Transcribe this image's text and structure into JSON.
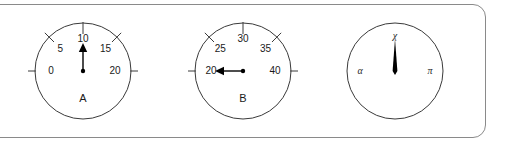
{
  "panel": {
    "border_color": "#8a8a8a",
    "background_color": "#ffffff"
  },
  "gauges": [
    {
      "id": "gauge-a",
      "name": "A",
      "cx": 83,
      "cy": 71,
      "r": 48,
      "needle_value": 10,
      "needle_angle_deg": 0,
      "needle_style": "arrow",
      "ticks": [
        {
          "label": "0",
          "angle_deg": -90,
          "style": "outside"
        },
        {
          "label": "5",
          "angle_deg": -45,
          "style": "crossing"
        },
        {
          "label": "10",
          "angle_deg": 0,
          "style": "inside"
        },
        {
          "label": "15",
          "angle_deg": 45,
          "style": "crossing"
        },
        {
          "label": "20",
          "angle_deg": 90,
          "style": "outside"
        }
      ]
    },
    {
      "id": "gauge-b",
      "name": "B",
      "cx": 243,
      "cy": 71,
      "r": 48,
      "needle_value": 20,
      "needle_angle_deg": -90,
      "needle_style": "arrow",
      "ticks": [
        {
          "label": "20",
          "angle_deg": -90,
          "style": "outside"
        },
        {
          "label": "25",
          "angle_deg": -45,
          "style": "crossing"
        },
        {
          "label": "30",
          "angle_deg": 0,
          "style": "inside"
        },
        {
          "label": "35",
          "angle_deg": 45,
          "style": "crossing"
        },
        {
          "label": "40",
          "angle_deg": 90,
          "style": "outside"
        }
      ]
    },
    {
      "id": "gauge-c",
      "name": "",
      "cx": 395,
      "cy": 71,
      "r": 48,
      "needle_value": "chi",
      "needle_angle_deg": 0,
      "needle_style": "solid-taper",
      "ticks": [
        {
          "label": "α",
          "angle_deg": -90,
          "style": "none"
        },
        {
          "label": "χ",
          "angle_deg": 0,
          "style": "none"
        },
        {
          "label": "π",
          "angle_deg": 90,
          "style": "none"
        }
      ]
    }
  ]
}
